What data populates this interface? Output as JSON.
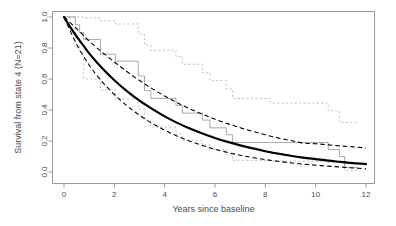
{
  "chart_data": {
    "type": "line",
    "title": "",
    "subtitle": "",
    "xlabel": "Years since baseline",
    "ylabel": "Survival from state 4 (N=21)",
    "xlim": [
      0,
      12
    ],
    "ylim": [
      0.0,
      1.0
    ],
    "xticks": [
      0,
      2,
      4,
      6,
      8,
      10,
      12
    ],
    "xticklabels": [
      "0",
      "2",
      "4",
      "6",
      "8",
      "10",
      "12"
    ],
    "yticks": [
      0.0,
      0.2,
      0.4,
      0.6,
      0.8,
      1.0
    ],
    "yticklabels": [
      "0.0",
      "0.2",
      "0.4",
      "0.6",
      "0.8",
      "1.0"
    ],
    "grid": false,
    "legend": "none",
    "colors": {
      "fit_curve": "#000000",
      "fit_ci": "#000000",
      "km_step": "#9a9a9a",
      "km_ci": "#b8b8b8",
      "axis": "#808080",
      "text": "#4d4d4d",
      "background": "#ffffff"
    },
    "series": [
      {
        "name": "Model-based survival (fitted)",
        "style": "solid-thick-black",
        "x": [
          0.0,
          0.25,
          0.5,
          0.75,
          1.0,
          1.5,
          2.0,
          2.5,
          3.0,
          3.5,
          4.0,
          4.5,
          5.0,
          5.5,
          6.0,
          6.5,
          7.0,
          7.5,
          8.0,
          8.5,
          9.0,
          9.5,
          10.0,
          10.5,
          11.0,
          11.5,
          12.0
        ],
        "values": [
          1.0,
          0.935,
          0.875,
          0.82,
          0.765,
          0.672,
          0.592,
          0.522,
          0.46,
          0.407,
          0.359,
          0.317,
          0.28,
          0.248,
          0.219,
          0.194,
          0.172,
          0.152,
          0.134,
          0.119,
          0.105,
          0.093,
          0.083,
          0.073,
          0.065,
          0.057,
          0.051
        ]
      },
      {
        "name": "Model-based 95% CI upper",
        "style": "dashed-black",
        "x": [
          0.0,
          0.5,
          1.0,
          1.5,
          2.0,
          2.5,
          3.0,
          3.5,
          4.0,
          4.5,
          5.0,
          5.5,
          6.0,
          6.5,
          7.0,
          7.5,
          8.0,
          8.5,
          9.0,
          9.5,
          10.0,
          10.5,
          11.0,
          11.5,
          12.0
        ],
        "values": [
          1.0,
          0.925,
          0.845,
          0.775,
          0.71,
          0.648,
          0.59,
          0.538,
          0.49,
          0.447,
          0.408,
          0.373,
          0.341,
          0.312,
          0.286,
          0.262,
          0.24,
          0.22,
          0.203,
          0.187,
          0.182,
          0.175,
          0.168,
          0.162,
          0.155
        ]
      },
      {
        "name": "Model-based 95% CI lower",
        "style": "dashed-black",
        "x": [
          0.0,
          0.5,
          1.0,
          1.5,
          2.0,
          2.5,
          3.0,
          3.5,
          4.0,
          4.5,
          5.0,
          5.5,
          6.0,
          6.5,
          7.0,
          7.5,
          8.0,
          8.5,
          9.0,
          9.5,
          10.0,
          10.5,
          11.0,
          11.5,
          12.0
        ],
        "values": [
          1.0,
          0.825,
          0.69,
          0.585,
          0.5,
          0.428,
          0.366,
          0.314,
          0.27,
          0.231,
          0.199,
          0.171,
          0.147,
          0.126,
          0.108,
          0.093,
          0.08,
          0.069,
          0.059,
          0.051,
          0.044,
          0.038,
          0.032,
          0.026,
          0.02
        ]
      },
      {
        "name": "Kaplan-Meier estimate",
        "style": "step-gray",
        "x": [
          0.0,
          0.45,
          0.45,
          0.62,
          0.62,
          0.78,
          0.78,
          1.45,
          1.45,
          2.05,
          2.05,
          2.95,
          2.95,
          3.2,
          3.2,
          3.45,
          3.45,
          4.45,
          4.45,
          4.7,
          4.7,
          5.5,
          5.5,
          5.8,
          5.8,
          6.45,
          6.45,
          6.7,
          6.7,
          8.2,
          8.2,
          10.5,
          10.5,
          10.95,
          10.95,
          11.15,
          11.15,
          11.7
        ],
        "values": [
          1.0,
          1.0,
          0.95,
          0.95,
          0.9,
          0.9,
          0.855,
          0.855,
          0.76,
          0.76,
          0.715,
          0.715,
          0.62,
          0.62,
          0.525,
          0.525,
          0.475,
          0.475,
          0.43,
          0.43,
          0.38,
          0.38,
          0.335,
          0.335,
          0.285,
          0.285,
          0.24,
          0.24,
          0.19,
          0.19,
          0.19,
          0.19,
          0.145,
          0.145,
          0.1,
          0.1,
          0.03,
          0.03
        ]
      },
      {
        "name": "Kaplan-Meier 95% CI upper",
        "style": "step-dotted-gray",
        "x": [
          0.0,
          0.45,
          0.45,
          0.62,
          0.62,
          0.78,
          0.78,
          1.45,
          1.45,
          2.05,
          2.05,
          2.95,
          2.95,
          3.2,
          3.2,
          3.45,
          3.45,
          4.45,
          4.45,
          4.7,
          4.7,
          5.5,
          5.5,
          5.8,
          5.8,
          6.45,
          6.45,
          6.7,
          6.7,
          8.2,
          8.2,
          10.5,
          10.5,
          10.95,
          10.95,
          11.7
        ],
        "values": [
          1.0,
          1.0,
          1.0,
          1.0,
          1.0,
          1.0,
          0.995,
          0.995,
          0.975,
          0.975,
          0.955,
          0.955,
          0.89,
          0.89,
          0.82,
          0.82,
          0.785,
          0.785,
          0.745,
          0.745,
          0.695,
          0.695,
          0.64,
          0.64,
          0.59,
          0.59,
          0.535,
          0.535,
          0.475,
          0.475,
          0.445,
          0.445,
          0.395,
          0.395,
          0.32,
          0.32
        ]
      },
      {
        "name": "Kaplan-Meier 95% CI lower",
        "style": "step-dotted-gray",
        "x": [
          0.0,
          0.45,
          0.45,
          0.62,
          0.62,
          0.78,
          0.78,
          1.45,
          1.45,
          2.05,
          2.05,
          2.95,
          2.95,
          3.2,
          3.2,
          3.45,
          3.45,
          4.45,
          4.45,
          4.7,
          4.7,
          5.5,
          5.5,
          5.8,
          5.8,
          6.45,
          6.45,
          6.7,
          6.7,
          8.2,
          8.2,
          10.5,
          10.5,
          11.15,
          11.15,
          11.7
        ],
        "values": [
          1.0,
          1.0,
          0.86,
          0.86,
          0.77,
          0.77,
          0.6,
          0.6,
          0.53,
          0.53,
          0.47,
          0.47,
          0.405,
          0.405,
          0.335,
          0.335,
          0.29,
          0.29,
          0.245,
          0.245,
          0.205,
          0.205,
          0.175,
          0.175,
          0.145,
          0.145,
          0.11,
          0.11,
          0.075,
          0.075,
          0.07,
          0.07,
          0.06,
          0.06,
          0.01,
          0.01
        ]
      }
    ]
  }
}
